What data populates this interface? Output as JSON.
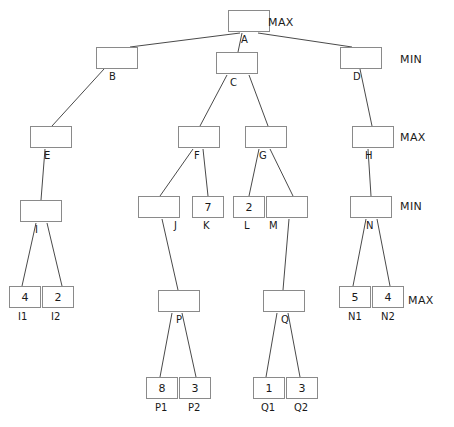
{
  "diagram": {
    "node_width": 42,
    "node_height": 22,
    "leaf_width": 32,
    "leaf_height": 22,
    "stroke_color": "#8a8a8a",
    "edge_color": "#4a4a4a",
    "background": "#ffffff"
  },
  "level_labels": [
    {
      "text": "MAX",
      "x": 268,
      "y": 17
    },
    {
      "text": "MIN",
      "x": 400,
      "y": 54
    },
    {
      "text": "MAX",
      "x": 400,
      "y": 132
    },
    {
      "text": "MIN",
      "x": 400,
      "y": 201
    },
    {
      "text": "MAX",
      "x": 408,
      "y": 295
    }
  ],
  "nodes": [
    {
      "id": "A",
      "label": "A",
      "value": "",
      "x": 228,
      "y": 10,
      "w": 42,
      "h": 22,
      "label_x": 241,
      "label_y": 35,
      "leaf": false
    },
    {
      "id": "B",
      "label": "B",
      "value": "",
      "x": 96,
      "y": 47,
      "w": 42,
      "h": 22,
      "label_x": 109,
      "label_y": 72,
      "leaf": false
    },
    {
      "id": "C",
      "label": "C",
      "value": "",
      "x": 216,
      "y": 52,
      "w": 42,
      "h": 22,
      "label_x": 230,
      "label_y": 78,
      "leaf": false
    },
    {
      "id": "D",
      "label": "D",
      "value": "",
      "x": 340,
      "y": 47,
      "w": 42,
      "h": 22,
      "label_x": 353,
      "label_y": 72,
      "leaf": false
    },
    {
      "id": "E",
      "label": "E",
      "value": "",
      "x": 30,
      "y": 126,
      "w": 42,
      "h": 22,
      "label_x": 44,
      "label_y": 151,
      "leaf": false
    },
    {
      "id": "F",
      "label": "F",
      "value": "",
      "x": 178,
      "y": 126,
      "w": 42,
      "h": 22,
      "label_x": 194,
      "label_y": 151,
      "leaf": false
    },
    {
      "id": "G",
      "label": "G",
      "value": "",
      "x": 245,
      "y": 126,
      "w": 42,
      "h": 22,
      "label_x": 259,
      "label_y": 151,
      "leaf": false
    },
    {
      "id": "H",
      "label": "H",
      "value": "",
      "x": 352,
      "y": 126,
      "w": 42,
      "h": 22,
      "label_x": 365,
      "label_y": 151,
      "leaf": false
    },
    {
      "id": "I",
      "label": "I",
      "value": "",
      "x": 20,
      "y": 200,
      "w": 42,
      "h": 22,
      "label_x": 35,
      "label_y": 225,
      "leaf": false
    },
    {
      "id": "J",
      "label": "J",
      "value": "",
      "x": 138,
      "y": 196,
      "w": 42,
      "h": 22,
      "label_x": 174,
      "label_y": 221,
      "leaf": false
    },
    {
      "id": "K",
      "label": "K",
      "value": "7",
      "x": 192,
      "y": 196,
      "w": 32,
      "h": 22,
      "label_x": 203,
      "label_y": 221,
      "leaf": true
    },
    {
      "id": "L",
      "label": "L",
      "value": "2",
      "x": 233,
      "y": 196,
      "w": 32,
      "h": 22,
      "label_x": 244,
      "label_y": 221,
      "leaf": true
    },
    {
      "id": "M",
      "label": "M",
      "value": "",
      "x": 266,
      "y": 196,
      "w": 42,
      "h": 22,
      "label_x": 269,
      "label_y": 221,
      "leaf": false
    },
    {
      "id": "N",
      "label": "N",
      "value": "",
      "x": 350,
      "y": 196,
      "w": 42,
      "h": 22,
      "label_x": 366,
      "label_y": 221,
      "leaf": false
    },
    {
      "id": "P",
      "label": "P",
      "value": "",
      "x": 158,
      "y": 290,
      "w": 42,
      "h": 22,
      "label_x": 176,
      "label_y": 315,
      "leaf": false
    },
    {
      "id": "Q",
      "label": "Q",
      "value": "",
      "x": 263,
      "y": 290,
      "w": 42,
      "h": 22,
      "label_x": 281,
      "label_y": 315,
      "leaf": false
    },
    {
      "id": "I1",
      "label": "I1",
      "value": "4",
      "x": 9,
      "y": 286,
      "w": 32,
      "h": 22,
      "label_x": 18,
      "label_y": 312,
      "leaf": true
    },
    {
      "id": "I2",
      "label": "I2",
      "value": "2",
      "x": 42,
      "y": 286,
      "w": 32,
      "h": 22,
      "label_x": 51,
      "label_y": 312,
      "leaf": true
    },
    {
      "id": "N1",
      "label": "N1",
      "value": "5",
      "x": 339,
      "y": 286,
      "w": 32,
      "h": 22,
      "label_x": 348,
      "label_y": 312,
      "leaf": true
    },
    {
      "id": "N2",
      "label": "N2",
      "value": "4",
      "x": 372,
      "y": 286,
      "w": 32,
      "h": 22,
      "label_x": 381,
      "label_y": 312,
      "leaf": true
    },
    {
      "id": "P1",
      "label": "P1",
      "value": "8",
      "x": 146,
      "y": 377,
      "w": 32,
      "h": 22,
      "label_x": 155,
      "label_y": 403,
      "leaf": true
    },
    {
      "id": "P2",
      "label": "P2",
      "value": "3",
      "x": 179,
      "y": 377,
      "w": 32,
      "h": 22,
      "label_x": 188,
      "label_y": 403,
      "leaf": true
    },
    {
      "id": "Q1",
      "label": "Q1",
      "value": "1",
      "x": 253,
      "y": 377,
      "w": 32,
      "h": 22,
      "label_x": 261,
      "label_y": 403,
      "leaf": true
    },
    {
      "id": "Q2",
      "label": "Q2",
      "value": "3",
      "x": 286,
      "y": 377,
      "w": 32,
      "h": 22,
      "label_x": 294,
      "label_y": 403,
      "leaf": true
    }
  ],
  "edges": [
    {
      "from": "A",
      "to": "B",
      "x1": 240,
      "y1": 33,
      "x2": 130,
      "y2": 47
    },
    {
      "from": "A",
      "to": "C",
      "x1": 242,
      "y1": 33,
      "x2": 238,
      "y2": 52
    },
    {
      "from": "A",
      "to": "D",
      "x1": 258,
      "y1": 33,
      "x2": 352,
      "y2": 47
    },
    {
      "from": "B",
      "to": "E",
      "x1": 104,
      "y1": 69,
      "x2": 52,
      "y2": 126
    },
    {
      "from": "C",
      "to": "F",
      "x1": 227,
      "y1": 75,
      "x2": 200,
      "y2": 126
    },
    {
      "from": "C",
      "to": "G",
      "x1": 249,
      "y1": 75,
      "x2": 268,
      "y2": 126
    },
    {
      "from": "D",
      "to": "H",
      "x1": 360,
      "y1": 69,
      "x2": 372,
      "y2": 126
    },
    {
      "from": "E",
      "to": "I",
      "x1": 45,
      "y1": 149,
      "x2": 41,
      "y2": 200
    },
    {
      "from": "F",
      "to": "J",
      "x1": 193,
      "y1": 149,
      "x2": 160,
      "y2": 196
    },
    {
      "from": "F",
      "to": "K",
      "x1": 203,
      "y1": 149,
      "x2": 208,
      "y2": 196
    },
    {
      "from": "G",
      "to": "L",
      "x1": 259,
      "y1": 149,
      "x2": 249,
      "y2": 196
    },
    {
      "from": "G",
      "to": "M",
      "x1": 270,
      "y1": 149,
      "x2": 293,
      "y2": 196
    },
    {
      "from": "H",
      "to": "N",
      "x1": 368,
      "y1": 149,
      "x2": 371,
      "y2": 196
    },
    {
      "from": "I",
      "to": "I1",
      "x1": 36,
      "y1": 223,
      "x2": 22,
      "y2": 286
    },
    {
      "from": "I",
      "to": "I2",
      "x1": 47,
      "y1": 223,
      "x2": 62,
      "y2": 286
    },
    {
      "from": "J",
      "to": "P",
      "x1": 162,
      "y1": 219,
      "x2": 178,
      "y2": 290
    },
    {
      "from": "M",
      "to": "Q",
      "x1": 289,
      "y1": 219,
      "x2": 283,
      "y2": 290
    },
    {
      "from": "N",
      "to": "N1",
      "x1": 366,
      "y1": 219,
      "x2": 353,
      "y2": 286
    },
    {
      "from": "N",
      "to": "N2",
      "x1": 377,
      "y1": 219,
      "x2": 390,
      "y2": 286
    },
    {
      "from": "P",
      "to": "P1",
      "x1": 172,
      "y1": 313,
      "x2": 160,
      "y2": 377
    },
    {
      "from": "P",
      "to": "P2",
      "x1": 182,
      "y1": 313,
      "x2": 196,
      "y2": 377
    },
    {
      "from": "Q",
      "to": "Q1",
      "x1": 277,
      "y1": 313,
      "x2": 266,
      "y2": 377
    },
    {
      "from": "Q",
      "to": "Q2",
      "x1": 288,
      "y1": 313,
      "x2": 300,
      "y2": 377
    }
  ]
}
